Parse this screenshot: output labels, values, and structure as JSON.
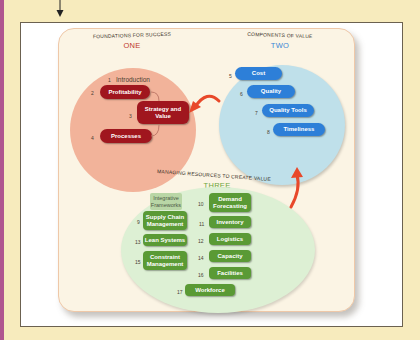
{
  "colors": {
    "page_background": "#f7ebbd",
    "left_strip": "#b0568f",
    "section_one": "#f2b39a",
    "section_two": "#bfe0ea",
    "section_three": "#ddf0d4",
    "pill_red": "#a0161e",
    "pill_blue": "#2d7fd8",
    "pill_green": "#5a9a35",
    "arrow": "#e8482a"
  },
  "sections": {
    "one": {
      "title": "Foundations for Success",
      "number": "ONE",
      "items": [
        {
          "num": "1",
          "label": "Introduction",
          "style": "plain"
        },
        {
          "num": "2",
          "label": "Profitability",
          "style": "pill"
        },
        {
          "num": "3",
          "label": "Strategy and Value",
          "style": "pill"
        },
        {
          "num": "4",
          "label": "Processes",
          "style": "pill"
        }
      ]
    },
    "two": {
      "title": "Components of Value",
      "number": "TWO",
      "items": [
        {
          "num": "5",
          "label": "Cost"
        },
        {
          "num": "6",
          "label": "Quality"
        },
        {
          "num": "7",
          "label": "Quality Tools"
        },
        {
          "num": "8",
          "label": "Timeliness"
        }
      ]
    },
    "three": {
      "title": "Managing Resources to Create Value",
      "number": "THREE",
      "header_box": "Integrative Frameworks",
      "left_items": [
        {
          "num": "9",
          "label": "Supply Chain Management"
        },
        {
          "num": "13",
          "label": "Lean Systems"
        },
        {
          "num": "15",
          "label": "Constraint Management"
        }
      ],
      "right_items": [
        {
          "num": "10",
          "label": "Demand Forecasting"
        },
        {
          "num": "11",
          "label": "Inventory"
        },
        {
          "num": "12",
          "label": "Logistics"
        },
        {
          "num": "14",
          "label": "Capacity"
        },
        {
          "num": "16",
          "label": "Facilities"
        }
      ],
      "bottom_item": {
        "num": "17",
        "label": "Workforce"
      }
    }
  }
}
